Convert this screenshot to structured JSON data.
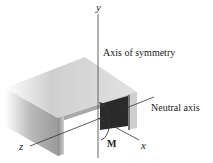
{
  "diagram": {
    "labels": {
      "y_axis": "y",
      "z_axis": "z",
      "x_axis": "x",
      "moment": "M",
      "axis_of_symmetry": "Axis of symmetry",
      "neutral_axis": "Neutral axis"
    },
    "colors": {
      "axis_line": "#555555",
      "beam_light": "#d8d8d8",
      "beam_dark": "#2a2a2a",
      "text": "#222222"
    }
  }
}
